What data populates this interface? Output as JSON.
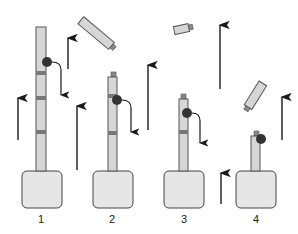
{
  "diagram": {
    "type": "sequential-process",
    "colors": {
      "shaft_fill": "#d6d6d6",
      "shaft_stroke": "#555555",
      "band": "#777777",
      "base_fill": "#e6e6e6",
      "base_stroke": "#444444",
      "ball": "#333333",
      "arrow": "#1a1a1a",
      "cap": "#888888"
    },
    "stages": [
      {
        "label": "1"
      },
      {
        "label": "2"
      },
      {
        "label": "3"
      },
      {
        "label": "4"
      }
    ]
  }
}
